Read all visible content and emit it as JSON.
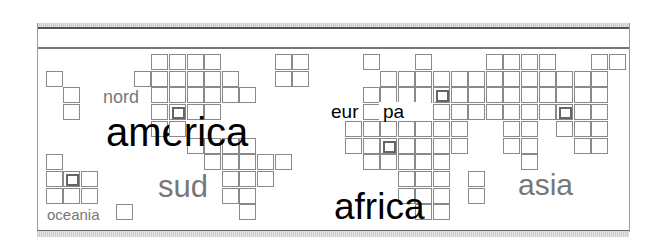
{
  "grid": {
    "origin_x": 45.7,
    "origin_y": 54,
    "step_x": 17.6,
    "step_y": 16.7,
    "cells": [
      {
        "c": 6,
        "r": 0
      },
      {
        "c": 7,
        "r": 0
      },
      {
        "c": 8,
        "r": 0
      },
      {
        "c": 9,
        "r": 0
      },
      {
        "c": 0,
        "r": 1
      },
      {
        "c": 1,
        "r": 2
      },
      {
        "c": 1,
        "r": 3
      },
      {
        "c": 5,
        "r": 1
      },
      {
        "c": 6,
        "r": 1
      },
      {
        "c": 7,
        "r": 1
      },
      {
        "c": 8,
        "r": 1
      },
      {
        "c": 9,
        "r": 1
      },
      {
        "c": 10,
        "r": 1
      },
      {
        "c": 6,
        "r": 2
      },
      {
        "c": 7,
        "r": 2
      },
      {
        "c": 8,
        "r": 2
      },
      {
        "c": 9,
        "r": 2
      },
      {
        "c": 10,
        "r": 2
      },
      {
        "c": 11,
        "r": 2
      },
      {
        "c": 6,
        "r": 3
      },
      {
        "c": 7,
        "r": 3,
        "hl": true
      },
      {
        "c": 8,
        "r": 3
      },
      {
        "c": 9,
        "r": 3
      },
      {
        "c": 6,
        "r": 4
      },
      {
        "c": 7,
        "r": 4,
        "top": true
      },
      {
        "c": 8,
        "r": 5
      },
      {
        "c": 9,
        "r": 5
      },
      {
        "c": 10,
        "r": 5
      },
      {
        "c": 11,
        "r": 5
      },
      {
        "c": 9,
        "r": 6
      },
      {
        "c": 10,
        "r": 6
      },
      {
        "c": 11,
        "r": 6
      },
      {
        "c": 12,
        "r": 6
      },
      {
        "c": 13,
        "r": 6
      },
      {
        "c": 10,
        "r": 7
      },
      {
        "c": 11,
        "r": 7
      },
      {
        "c": 12,
        "r": 7
      },
      {
        "c": 10,
        "r": 8
      },
      {
        "c": 11,
        "r": 8
      },
      {
        "c": 11,
        "r": 9
      },
      {
        "c": 13,
        "r": 0
      },
      {
        "c": 14,
        "r": 0
      },
      {
        "c": 13,
        "r": 1
      },
      {
        "c": 14,
        "r": 1
      },
      {
        "c": 0,
        "r": 6
      },
      {
        "c": 0,
        "r": 7
      },
      {
        "c": 1,
        "r": 7,
        "hl": true
      },
      {
        "c": 2,
        "r": 7
      },
      {
        "c": 0,
        "r": 8
      },
      {
        "c": 1,
        "r": 8
      },
      {
        "c": 2,
        "r": 8
      },
      {
        "c": 4,
        "r": 9
      },
      {
        "c": 18,
        "r": 0
      },
      {
        "c": 21,
        "r": 0
      },
      {
        "c": 19,
        "r": 1
      },
      {
        "c": 20,
        "r": 1
      },
      {
        "c": 21,
        "r": 1
      },
      {
        "c": 22,
        "r": 1
      },
      {
        "c": 23,
        "r": 1
      },
      {
        "c": 24,
        "r": 1
      },
      {
        "c": 18,
        "r": 2
      },
      {
        "c": 19,
        "r": 2
      },
      {
        "c": 20,
        "r": 2
      },
      {
        "c": 21,
        "r": 2
      },
      {
        "c": 22,
        "r": 2,
        "hl": true
      },
      {
        "c": 23,
        "r": 2
      },
      {
        "c": 24,
        "r": 2
      },
      {
        "c": 18,
        "r": 3
      },
      {
        "c": 22,
        "r": 3
      },
      {
        "c": 23,
        "r": 3
      },
      {
        "c": 24,
        "r": 3
      },
      {
        "c": 17,
        "r": 4
      },
      {
        "c": 18,
        "r": 4
      },
      {
        "c": 19,
        "r": 4
      },
      {
        "c": 20,
        "r": 4
      },
      {
        "c": 21,
        "r": 4
      },
      {
        "c": 22,
        "r": 4
      },
      {
        "c": 23,
        "r": 4
      },
      {
        "c": 17,
        "r": 5
      },
      {
        "c": 18,
        "r": 5
      },
      {
        "c": 19,
        "r": 5,
        "hl": true
      },
      {
        "c": 20,
        "r": 5
      },
      {
        "c": 21,
        "r": 5
      },
      {
        "c": 22,
        "r": 5
      },
      {
        "c": 23,
        "r": 5
      },
      {
        "c": 18,
        "r": 6
      },
      {
        "c": 19,
        "r": 6
      },
      {
        "c": 20,
        "r": 6
      },
      {
        "c": 21,
        "r": 6
      },
      {
        "c": 22,
        "r": 6
      },
      {
        "c": 20,
        "r": 7
      },
      {
        "c": 21,
        "r": 7
      },
      {
        "c": 22,
        "r": 7
      },
      {
        "c": 20,
        "r": 8
      },
      {
        "c": 21,
        "r": 8
      },
      {
        "c": 22,
        "r": 8
      },
      {
        "c": 21,
        "r": 9
      },
      {
        "c": 22,
        "r": 9
      },
      {
        "c": 24,
        "r": 7
      },
      {
        "c": 24,
        "r": 8
      },
      {
        "c": 25,
        "r": 0
      },
      {
        "c": 26,
        "r": 0
      },
      {
        "c": 27,
        "r": 0
      },
      {
        "c": 28,
        "r": 0
      },
      {
        "c": 31,
        "r": 0
      },
      {
        "c": 32,
        "r": 0
      },
      {
        "c": 25,
        "r": 1
      },
      {
        "c": 26,
        "r": 1
      },
      {
        "c": 27,
        "r": 1
      },
      {
        "c": 28,
        "r": 1
      },
      {
        "c": 29,
        "r": 1
      },
      {
        "c": 30,
        "r": 1
      },
      {
        "c": 31,
        "r": 1
      },
      {
        "c": 25,
        "r": 2
      },
      {
        "c": 26,
        "r": 2
      },
      {
        "c": 27,
        "r": 2
      },
      {
        "c": 28,
        "r": 2
      },
      {
        "c": 29,
        "r": 2
      },
      {
        "c": 30,
        "r": 2
      },
      {
        "c": 31,
        "r": 2
      },
      {
        "c": 25,
        "r": 3
      },
      {
        "c": 26,
        "r": 3
      },
      {
        "c": 27,
        "r": 3
      },
      {
        "c": 28,
        "r": 3
      },
      {
        "c": 29,
        "r": 3,
        "hl": true
      },
      {
        "c": 30,
        "r": 3
      },
      {
        "c": 31,
        "r": 3
      },
      {
        "c": 26,
        "r": 4
      },
      {
        "c": 27,
        "r": 4
      },
      {
        "c": 29,
        "r": 4
      },
      {
        "c": 30,
        "r": 4
      },
      {
        "c": 31,
        "r": 4
      },
      {
        "c": 26,
        "r": 5
      },
      {
        "c": 27,
        "r": 5
      },
      {
        "c": 30,
        "r": 5
      },
      {
        "c": 31,
        "r": 5
      },
      {
        "c": 27,
        "r": 6
      }
    ]
  },
  "labels": {
    "nord": {
      "text": "nord",
      "x": 103,
      "y": 88,
      "size": 18,
      "color": "#777777"
    },
    "america": {
      "text": "america",
      "x": 106,
      "y": 112,
      "size": 40,
      "color": "#000000"
    },
    "sud": {
      "text": "sud",
      "x": 158,
      "y": 171,
      "size": 31,
      "color": "#777777"
    },
    "oceania": {
      "text": "oceania",
      "x": 47,
      "y": 207,
      "size": 15,
      "color": "#777777"
    },
    "europa_left": {
      "text": "eur",
      "x": 331,
      "y": 102,
      "size": 19,
      "color": "#000000"
    },
    "europa_right": {
      "text": "pa",
      "x": 379,
      "y": 102,
      "size": 19,
      "color": "#000000"
    },
    "africa": {
      "text": "africa",
      "x": 334,
      "y": 188,
      "size": 37,
      "color": "#000000"
    },
    "asia": {
      "text": "asia",
      "x": 518,
      "y": 170,
      "size": 30,
      "color": "#777777"
    }
  }
}
